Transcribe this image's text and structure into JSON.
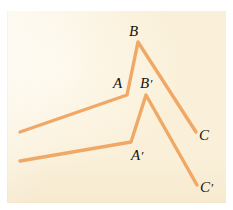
{
  "figure": {
    "background_color": "#faf0d9",
    "page_color": "#ffffff",
    "stroke_color": "#f0a867",
    "label_color": "#18130f",
    "stroke_width": 3.4,
    "panel": {
      "x": 7,
      "y": 11,
      "width": 219,
      "height": 192
    },
    "polylines": [
      {
        "name": "polyline-ABC",
        "points": "20,132 127,95 138,42 196,132",
        "vertices": [
          {
            "id": "start-upper",
            "x": 20,
            "y": 132
          },
          {
            "id": "A",
            "x": 127,
            "y": 95
          },
          {
            "id": "B",
            "x": 138,
            "y": 42
          },
          {
            "id": "C",
            "x": 196,
            "y": 132
          }
        ]
      },
      {
        "name": "polyline-A-prime-B-prime-C-prime",
        "points": "20,161 131,142 146,95 197,185",
        "vertices": [
          {
            "id": "start-lower",
            "x": 20,
            "y": 161
          },
          {
            "id": "A'",
            "x": 131,
            "y": 142
          },
          {
            "id": "B'",
            "x": 146,
            "y": 95
          },
          {
            "id": "C'",
            "x": 197,
            "y": 185
          }
        ]
      }
    ],
    "labels": [
      {
        "id": "label-A",
        "text": "A",
        "prime": "",
        "x": 113,
        "y": 76
      },
      {
        "id": "label-B",
        "text": "B",
        "prime": "",
        "x": 129,
        "y": 24
      },
      {
        "id": "label-C",
        "text": "C",
        "prime": "",
        "x": 199,
        "y": 128
      },
      {
        "id": "label-A-prime",
        "text": "A",
        "prime": "′",
        "x": 131,
        "y": 148
      },
      {
        "id": "label-B-prime",
        "text": "B",
        "prime": "′",
        "x": 140,
        "y": 76
      },
      {
        "id": "label-C-prime",
        "text": "C",
        "prime": "′",
        "x": 200,
        "y": 180
      }
    ]
  }
}
